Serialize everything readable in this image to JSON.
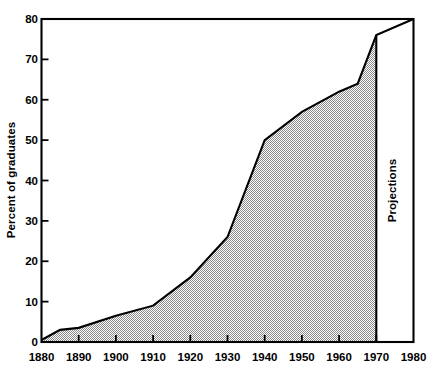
{
  "chart_data": {
    "type": "area",
    "title": "",
    "subtitle": "",
    "xlabel": "",
    "ylabel": "Percent of graduates",
    "xlim": [
      1880,
      1980
    ],
    "ylim": [
      0,
      80
    ],
    "grid": false,
    "legend_position": "none",
    "x_tick_labels": [
      "1880",
      "1890",
      "1900",
      "1910",
      "1920",
      "1930",
      "1940",
      "1950",
      "1960",
      "1970",
      "1980"
    ],
    "x_ticks": [
      1880,
      1890,
      1900,
      1910,
      1920,
      1930,
      1940,
      1950,
      1960,
      1970,
      1980
    ],
    "y_tick_labels": [
      "0",
      "10",
      "20",
      "30",
      "40",
      "50",
      "60",
      "70",
      "80"
    ],
    "y_ticks": [
      0,
      10,
      20,
      30,
      40,
      50,
      60,
      70,
      80
    ],
    "series": [
      {
        "name": "Percent of graduates",
        "x": [
          1880,
          1885,
          1890,
          1900,
          1910,
          1920,
          1930,
          1940,
          1950,
          1960,
          1965,
          1970,
          1980
        ],
        "values": [
          0.5,
          3.0,
          3.5,
          6.5,
          9.0,
          16.0,
          26.0,
          50.0,
          57.0,
          62.0,
          64.0,
          76.0,
          80.0
        ],
        "fill": "hatched-gray",
        "fill_through_year": 1970
      }
    ],
    "annotations": [
      {
        "name": "projections-divider",
        "text": "Projections",
        "x_from": 1970,
        "x_to": 1980,
        "orientation": "vertical"
      }
    ]
  },
  "axes": {
    "y_title": "Percent of graduates"
  },
  "annotation": {
    "projections": "Projections"
  },
  "colors": {
    "axis": "#000000",
    "line": "#000000",
    "fill": "#b3b3b3",
    "background": "#ffffff"
  }
}
